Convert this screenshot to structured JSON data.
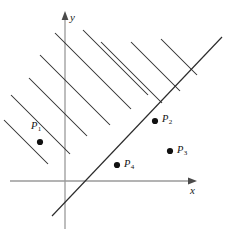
{
  "figure": {
    "background_color": "#ffffff",
    "axis_color": "#9a9a9a",
    "line_color": "#2b2b2b",
    "point_color": "#111111"
  },
  "axes": {
    "x_label": "x",
    "y_label": "y",
    "origin": {
      "x": 65,
      "y": 181
    },
    "x_axis": {
      "x1": 10,
      "y1": 181,
      "x2": 197,
      "y2": 181
    },
    "y_axis": {
      "x1": 65,
      "y1": 229,
      "x2": 65,
      "y2": 13
    }
  },
  "boundary": {
    "name": "diagonal-boundary-line",
    "slope": 1,
    "x1": 52,
    "y1": 216,
    "x2": 222,
    "y2": 37
  },
  "hatching": {
    "side": "upper-left",
    "angle_degrees": -45,
    "count": 9,
    "lines": [
      {
        "x1": 4,
        "y1": 120,
        "x2": 48,
        "y2": 164
      },
      {
        "x1": 11,
        "y1": 95,
        "x2": 70,
        "y2": 154
      },
      {
        "x1": 29,
        "y1": 78,
        "x2": 87,
        "y2": 136
      },
      {
        "x1": 40,
        "y1": 55,
        "x2": 110,
        "y2": 125
      },
      {
        "x1": 55,
        "y1": 33,
        "x2": 131,
        "y2": 109
      },
      {
        "x1": 83,
        "y1": 30,
        "x2": 148,
        "y2": 95
      },
      {
        "x1": 101,
        "y1": 42,
        "x2": 162,
        "y2": 103
      },
      {
        "x1": 131,
        "y1": 42,
        "x2": 180,
        "y2": 91
      },
      {
        "x1": 161,
        "y1": 39,
        "x2": 197,
        "y2": 75
      }
    ]
  },
  "points": [
    {
      "id": "P1",
      "label": "P",
      "subscript": "1",
      "dot_x": 40,
      "dot_y": 142,
      "label_x": 31,
      "label_y": 121
    },
    {
      "id": "P2",
      "label": "P",
      "subscript": "2",
      "dot_x": 155,
      "dot_y": 121,
      "label_x": 162,
      "label_y": 114
    },
    {
      "id": "P3",
      "label": "P",
      "subscript": "3",
      "dot_x": 170,
      "dot_y": 151,
      "label_x": 177,
      "label_y": 145
    },
    {
      "id": "P4",
      "label": "P",
      "subscript": "4",
      "dot_x": 117,
      "dot_y": 165,
      "label_x": 124,
      "label_y": 159
    }
  ]
}
